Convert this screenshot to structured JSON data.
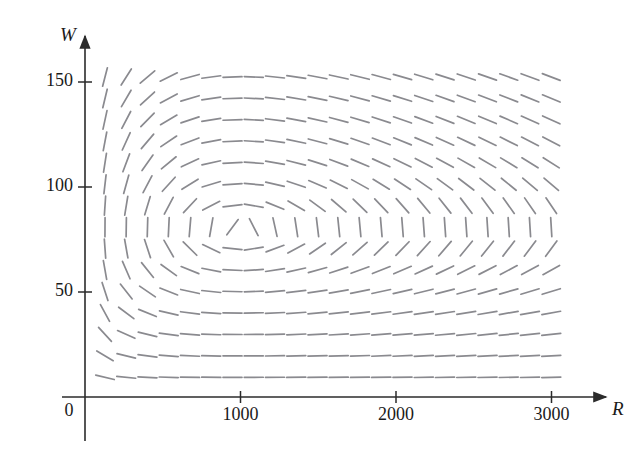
{
  "figure": {
    "title": "",
    "kind": "direction-field"
  },
  "axes": {
    "x_label": "R",
    "y_label": "W",
    "origin_label": "0",
    "x_ticks": [
      {
        "value": 1000,
        "label": "1000"
      },
      {
        "value": 2000,
        "label": "2000"
      },
      {
        "value": 3000,
        "label": "3000"
      }
    ],
    "y_ticks": [
      {
        "value": 50,
        "label": "50"
      },
      {
        "value": 100,
        "label": "100"
      },
      {
        "value": 150,
        "label": "150"
      }
    ],
    "axis_color": "#2b2b2b",
    "segment_color": "#8a8a8f"
  },
  "chart_data": {
    "type": "scatter",
    "title": "",
    "xlabel": "R",
    "ylabel": "W",
    "xlim": [
      0,
      3200
    ],
    "ylim": [
      0,
      165
    ],
    "grid": false,
    "legend": null,
    "model": {
      "equation": "dW/dR = W*(-c + d*R) / (R*(a - b*W))",
      "a": 0.08,
      "b": 0.001,
      "c": 0.02,
      "d": 2e-05,
      "equilibrium": {
        "R": 1000,
        "W": 80
      }
    },
    "sample_grid": {
      "R_values": [
        150,
        290,
        430,
        570,
        710,
        850,
        990,
        1130,
        1270,
        1410,
        1550,
        1690,
        1830,
        1970,
        2110,
        2250,
        2390,
        2530,
        2670,
        2810,
        2950,
        3000
      ],
      "W_values": [
        150,
        140,
        130,
        120,
        110,
        100,
        90,
        80,
        70,
        60,
        50,
        40,
        30,
        20,
        12
      ]
    },
    "segments_count": 330,
    "x_axis_range_label": [
      "0",
      "3000"
    ],
    "y_axis_range_label": [
      "0",
      "150"
    ]
  },
  "geometry": {
    "x_origin_px": 85,
    "y_origin_px": 397,
    "px_per_1000_R": 155.5,
    "px_per_50_W": 105,
    "grid_left_px": 105,
    "grid_top_px": 77,
    "grid_cols": 22,
    "grid_rows": 15,
    "col_step_px": 21.25,
    "row_step_px": 21.45,
    "seg_half_len_px": 9.5
  }
}
